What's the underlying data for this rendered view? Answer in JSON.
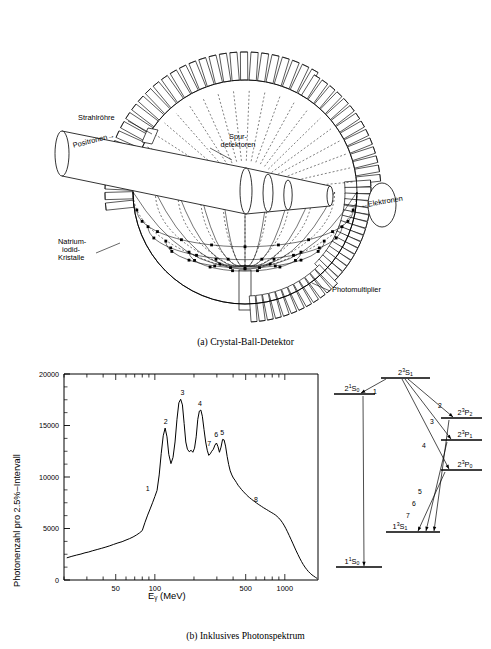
{
  "figure": {
    "panel_a": {
      "caption": "(a)  Crystal-Ball-Detektor",
      "labels": [
        {
          "name": "beam-pipe",
          "text": "Strahlröhre"
        },
        {
          "name": "positrons",
          "text": "Positronen→"
        },
        {
          "name": "track-detectors-line1",
          "text": "Spur-"
        },
        {
          "name": "track-detectors-line2",
          "text": "detektoren"
        },
        {
          "name": "electrons",
          "text": "←Elektronen"
        },
        {
          "name": "sodium-iodide-line1",
          "text": "Natrium-"
        },
        {
          "name": "sodium-iodide-line2",
          "text": "iodid-"
        },
        {
          "name": "sodium-iodide-line3",
          "text": "Kristalle"
        },
        {
          "name": "photomultiplier",
          "text": "Photomultiplier"
        }
      ]
    },
    "panel_b": {
      "caption": "(b)  Inklusives Photonspektrum"
    }
  },
  "chart_data": {
    "type": "line",
    "title": "Inklusives Photonspektrum",
    "xlabel": "Eγ (MeV)",
    "xlabel_base": "E",
    "xlabel_sub": "γ",
    "xlabel_unit": " (MeV)",
    "ylabel": "Photonenzahl pro 2.5%–Intervall",
    "xscale": "log",
    "xlim": [
      20,
      1800
    ],
    "ylim": [
      0,
      20000
    ],
    "grid": false,
    "legend": "none",
    "xticks": [
      50,
      100,
      500,
      1000
    ],
    "xtick_labels": [
      "50",
      "100",
      "500",
      "1000"
    ],
    "yticks": [
      0,
      5000,
      10000,
      15000,
      20000
    ],
    "ytick_labels": [
      "0",
      "5000",
      "10000",
      "15000",
      "20000"
    ],
    "annotations": [
      {
        "label": "1",
        "x": 88,
        "y": 8300
      },
      {
        "label": "2",
        "x": 121,
        "y": 14800
      },
      {
        "label": "3",
        "x": 163,
        "y": 17600
      },
      {
        "label": "4",
        "x": 222,
        "y": 16500
      },
      {
        "label": "5",
        "x": 330,
        "y": 13700
      },
      {
        "label": "6",
        "x": 296,
        "y": 13500
      },
      {
        "label": "7",
        "x": 262,
        "y": 12600
      },
      {
        "label": "8",
        "x": 600,
        "y": 7200
      }
    ],
    "x": [
      21,
      23,
      25,
      27,
      29,
      31,
      33,
      36,
      39,
      42,
      45,
      48,
      52,
      56,
      60,
      64,
      68,
      72,
      76,
      80,
      84,
      88,
      92,
      96,
      100,
      104,
      108,
      112,
      116,
      120,
      124,
      128,
      133,
      138,
      143,
      148,
      153,
      158,
      163,
      168,
      173,
      178,
      184,
      190,
      196,
      202,
      208,
      214,
      220,
      226,
      232,
      239,
      246,
      253,
      260,
      267,
      274,
      282,
      290,
      298,
      306,
      314,
      323,
      332,
      341,
      350,
      360,
      370,
      380,
      391,
      402,
      413,
      425,
      437,
      450,
      463,
      477,
      491,
      506,
      521,
      537,
      553,
      570,
      587,
      605,
      624,
      643,
      663,
      683,
      704,
      726,
      748,
      771,
      795,
      820,
      845,
      871,
      898,
      926,
      955,
      985,
      1016,
      1048,
      1081,
      1115,
      1150,
      1186,
      1223,
      1262,
      1302,
      1343,
      1385,
      1429,
      1474,
      1520,
      1568,
      1617,
      1668,
      1720,
      1774
    ],
    "y": [
      2150,
      2300,
      2420,
      2520,
      2640,
      2720,
      2830,
      2960,
      3080,
      3200,
      3320,
      3450,
      3600,
      3720,
      3880,
      4020,
      4180,
      4360,
      4560,
      4800,
      5600,
      6300,
      6900,
      7500,
      8100,
      8700,
      10200,
      12300,
      14000,
      14750,
      13900,
      12200,
      11300,
      11900,
      13400,
      15600,
      17200,
      17550,
      17000,
      15200,
      13400,
      12700,
      12450,
      12600,
      12400,
      12800,
      13900,
      15600,
      16400,
      16500,
      15900,
      14600,
      13400,
      12600,
      12100,
      12250,
      12500,
      12700,
      13100,
      13300,
      12950,
      12400,
      12900,
      13650,
      13600,
      13000,
      12000,
      11200,
      10600,
      10200,
      9900,
      9700,
      9450,
      9200,
      9000,
      8800,
      8620,
      8450,
      8280,
      8120,
      7980,
      7850,
      7720,
      7600,
      7480,
      7360,
      7250,
      7140,
      7030,
      6930,
      6830,
      6730,
      6630,
      6530,
      6430,
      6320,
      6180,
      6020,
      5830,
      5600,
      5330,
      5020,
      4680,
      4320,
      3950,
      3580,
      3200,
      2830,
      2470,
      2120,
      1800,
      1510,
      1250,
      1020,
      820,
      650,
      500,
      380,
      260,
      150,
      70,
      20
    ]
  },
  "level_diagram": {
    "type": "energy-level",
    "levels": [
      {
        "name": "level-2-3s1",
        "base": "2",
        "sup": "3",
        "letter": "S",
        "sub": "1",
        "text": "2³S₁"
      },
      {
        "name": "level-2-1s0",
        "base": "2",
        "sup": "1",
        "letter": "S",
        "sub": "0",
        "text": "2¹S₀"
      },
      {
        "name": "level-2-3p2",
        "base": "2",
        "sup": "3",
        "letter": "P",
        "sub": "2",
        "text": "2³P₂"
      },
      {
        "name": "level-2-3p1",
        "base": "2",
        "sup": "3",
        "letter": "P",
        "sub": "1",
        "text": "2³P₁"
      },
      {
        "name": "level-2-3p0",
        "base": "2",
        "sup": "3",
        "letter": "P",
        "sub": "0",
        "text": "2³P₀"
      },
      {
        "name": "level-1-3s1",
        "base": "1",
        "sup": "3",
        "letter": "S",
        "sub": "1",
        "text": "1³S₁"
      },
      {
        "name": "level-1-1s0",
        "base": "1",
        "sup": "1",
        "letter": "S",
        "sub": "0",
        "text": "1¹S₀"
      }
    ],
    "transitions": [
      {
        "name": "transition-1",
        "label": "1"
      },
      {
        "name": "transition-2",
        "label": "2"
      },
      {
        "name": "transition-3",
        "label": "3"
      },
      {
        "name": "transition-4",
        "label": "4"
      },
      {
        "name": "transition-5",
        "label": "5"
      },
      {
        "name": "transition-6",
        "label": "6"
      },
      {
        "name": "transition-7",
        "label": "7"
      }
    ]
  }
}
